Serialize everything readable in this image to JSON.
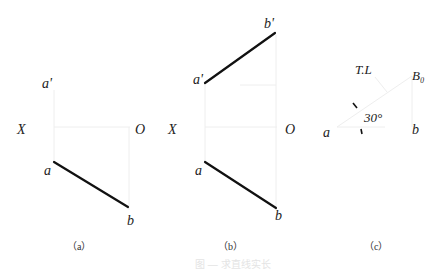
{
  "panels": [
    {
      "id": "a",
      "caption": "（a）",
      "labels": {
        "a_prime": "a'",
        "x_axis": "X",
        "origin": "O",
        "a": "a",
        "b": "b"
      }
    },
    {
      "id": "b",
      "caption": "（b）",
      "labels": {
        "a_prime": "a'",
        "b_prime": "b'",
        "x_axis": "X",
        "origin": "O",
        "a": "a",
        "b": "b"
      }
    },
    {
      "id": "c",
      "caption": "（c）",
      "labels": {
        "true_length": "T.L",
        "b0": "B₀",
        "angle": "30°",
        "a": "a",
        "b": "b"
      }
    }
  ],
  "figure_caption": "图 — 求直线实长"
}
